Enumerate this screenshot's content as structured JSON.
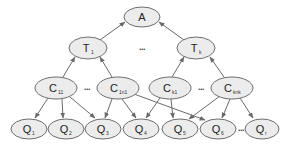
{
  "diagram": {
    "type": "hierarchical-dag",
    "colors": {
      "node_fill": "#ececec",
      "node_stroke": "#6e6e6e",
      "edge": "#6a6a6a",
      "text": "#222222"
    },
    "nodes": {
      "A": {
        "label": "A",
        "sub": ""
      },
      "T1": {
        "label": "T",
        "sub": "1"
      },
      "Tk": {
        "label": "T",
        "sub": "k"
      },
      "C11": {
        "label": "C",
        "sub": "11"
      },
      "C1n1": {
        "label": "C",
        "sub": "1n1"
      },
      "Ck1": {
        "label": "C",
        "sub": "k1"
      },
      "Cknk": {
        "label": "C",
        "sub": "knk"
      },
      "Q1": {
        "label": "Q",
        "sub": "1"
      },
      "Q2": {
        "label": "Q",
        "sub": "2"
      },
      "Q3": {
        "label": "Q",
        "sub": "3"
      },
      "Q4": {
        "label": "Q",
        "sub": "4"
      },
      "Q5": {
        "label": "Q",
        "sub": "5"
      },
      "Q6": {
        "label": "Q",
        "sub": "6"
      },
      "Qr": {
        "label": "Q",
        "sub": "r"
      }
    },
    "ellipses": {
      "t_level": "...",
      "c_left": "...",
      "c_right": "...",
      "q_level": "..."
    },
    "edges": [
      [
        "T1",
        "A"
      ],
      [
        "Tk",
        "A"
      ],
      [
        "C11",
        "T1"
      ],
      [
        "C1n1",
        "T1"
      ],
      [
        "Ck1",
        "Tk"
      ],
      [
        "Cknk",
        "Tk"
      ],
      [
        "C11",
        "Q1"
      ],
      [
        "C11",
        "Q2"
      ],
      [
        "C11",
        "Q3"
      ],
      [
        "C1n1",
        "Q3"
      ],
      [
        "C1n1",
        "Q4"
      ],
      [
        "C1n1",
        "Q6"
      ],
      [
        "Ck1",
        "Q4"
      ],
      [
        "Ck1",
        "Q5"
      ],
      [
        "Cknk",
        "Q5"
      ],
      [
        "Cknk",
        "Q6"
      ],
      [
        "Cknk",
        "Qr"
      ]
    ]
  }
}
